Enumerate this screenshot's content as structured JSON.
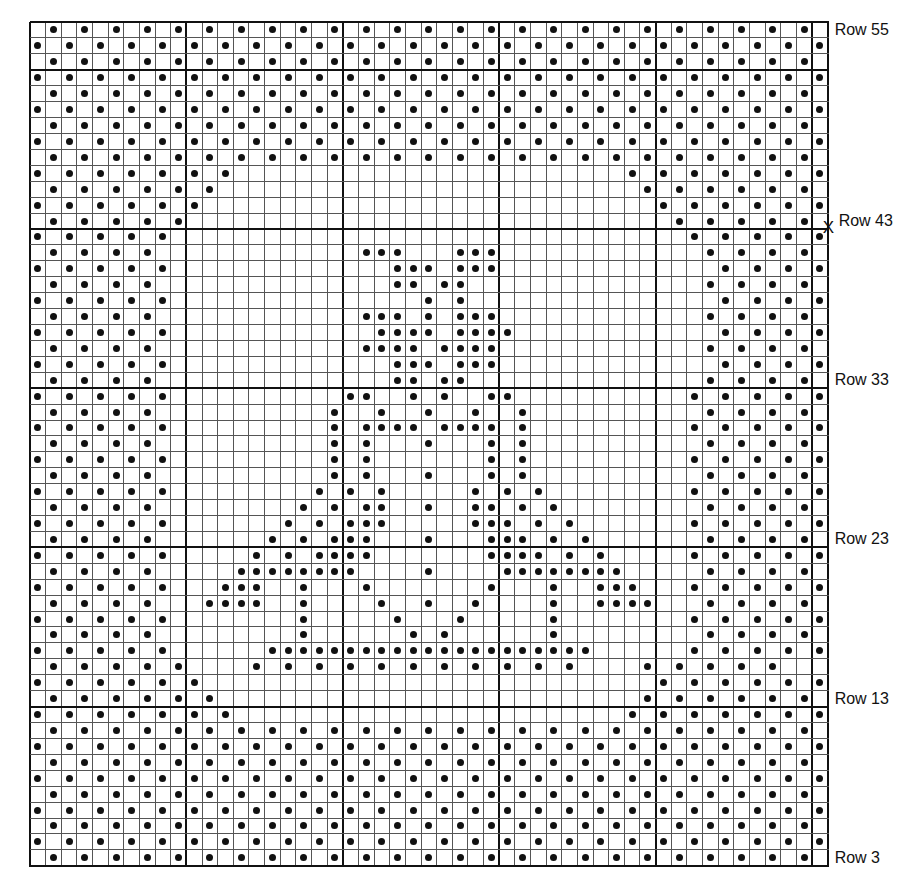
{
  "chart_title": "",
  "legend": {
    "dot": "filled cell",
    "blank": "empty cell"
  },
  "grid": {
    "columns": 51,
    "rows": 53,
    "first_row_number_top": 55,
    "last_row_number_bottom": 3,
    "major_col_lines": [
      0,
      10,
      20,
      30,
      40,
      50,
      51
    ],
    "major_row_lines": [
      0,
      3,
      13,
      23,
      33,
      43,
      53
    ],
    "dot_color": "#111111",
    "line_color": "#555555",
    "major_line_color": "#111111"
  },
  "row_labels": [
    {
      "row_index": 0,
      "text": "Row 55",
      "marker": ""
    },
    {
      "row_index": 12,
      "text": "Row 43",
      "marker": "X"
    },
    {
      "row_index": 22,
      "text": "Row 33",
      "marker": ""
    },
    {
      "row_index": 32,
      "text": "Row 23",
      "marker": ""
    },
    {
      "row_index": 42,
      "text": "Row 13",
      "marker": ""
    },
    {
      "row_index": 52,
      "text": "Row 3",
      "marker": ""
    }
  ],
  "chart_data": {
    "type": "heatmap",
    "xlabel": "",
    "ylabel": "Row",
    "legend": [
      "o = dot (filled block)",
      ". = open mesh"
    ],
    "row_order": "top-to-bottom, Row 55 first",
    "cells": [
      ".o.o.o.o.o.o.o.o.o.o.o.o.o.o.o.o.o.o.o.o.o.o.o.o.o.",
      "o.o.o.o.o.o.o.o.o.o.o.o.o.o.o.o.o.o.o.o.o.o.o.o.o.o",
      ".o.o.o.o.o.o.o.o.o.o.o.o.o.o.o.o.o.o.o.o.o.o.o.o.o.",
      "o.o.o.o.o.o.o.o.o.o.o.o.o.o.o.o.o.o.o.o.o.o.o.o.o.o",
      ".o.o.o.o.o.o.o.o.o.o.o.o.o.o.o.o.o.o.o.o.o.o.o.o.o.",
      "o.o.o.o.o.o.o.o.o.o.o.o.o.o.o.o.o.o.o.o.o.o.o.o.o.o",
      ".o.o.o.o.o.o.o.o.o.o.o.o.o.o.o.o.o.o.o.o.o.o.o.o.o.",
      "o.o.o.o.o.o.o.o.o.o.o.o.o.o.o.o.o.o.o.o.o.o.o.o.o.o",
      ".o.o.o.o.o.o.o.o.o.o.o.o.o.o.o.o.o.o.o.o.o.o.o.o.o.",
      "o.o.o.o.o.o.o.........................o.o.o.o.o.o.o",
      ".o.o.o.o.o.o...........................o.o.o.o.o.o.",
      "o.o.o.o.o.o.............................o.o.o.o.o.o",
      ".o.o.o.o.o...............................o.o.o.o.o.",
      "o.o.o.o.o.................................o.o.o.o.o",
      ".o.o.o.o.............ooo...ooo.............o.o.o.o.",
      "o.o.o.o.o..............ooo.ooo..............o.o.o.o.o",
      ".o.o.o.o...............oo.oo...............o.o.o.o.",
      "o.o.o.o.o................o.o................o.o.o.o.o",
      ".o.o.o.o.............ooo.o.ooo.............o.o.o.o.",
      "o.o.o.o.o.............oooo.oooo.............o.o.o.o.o",
      ".o.o.o.o.............oooo.oooo.............o.o.o.o.",
      "o.o.o.o.o..............ooo.ooo..............o.o.o.o.o",
      ".o.o.o.o...............oo.oo...............o.o.o.o.",
      "o.o.o.o.o...........oo..o.o..oo...........o.o.o.o.o",
      ".o.o.o.o...........o..o..o..o..o...........o.o.o.o.",
      "o.o.o.o.o..........o.oooo.oooo.o..........o.o.o.o.o",
      ".o.o.o.o...........o.o...o...o.o...........o.o.o.o.",
      "o.o.o.o.o..........o.o.......o.o..........o.o.o.o.o",
      ".o.o.o.o...........o.o...o...o.o...........o.o.o.o.",
      "o.o.o.o.o.........o.o.o.....o.o.o.........o.o.o.o.o",
      ".o.o.o.o.........o.o.oo..o..oo.o.o.........o.o.o.o.",
      "o.o.o.o.o.......o.o.ooo.....ooo.o.o.......o.o.o.o.o",
      ".o.o.o.o.......o.o.ooo...o...ooo.o.o.......o.o.o.o.",
      "o.o.o.o.o.....o.o.oooo.......oooo.o.o.....o.o.o.o.o",
      ".o.o.o.o.....oooooooo....o....oooooooo.....o.o.o.o.",
      "o.o.o.o.o...ooo..o...o.......o...o..ooo...o.o.o.o.o",
      ".o.o.o.o...oooo..o....o..o..o....o..oooo...o.o.o.o.",
      "o.o.o.o.o........o.....o...o.....o........o.o.o.o.o",
      ".o.o.o.o.........o......o.o......o.........o.o.o.o.",
      "o.o.o.o.o......ooooooooooooooooooooo......o.o.o.o.o",
      ".o.o.o.o.o....o.o.o.o.o.o.o.o.o.o.o....o.o.o.o.o.",
      "o.o.o.o.o.o.............................o.o.o.o.o.o",
      ".o.o.o.o.o.o...........................o.o.o.o.o.o.",
      "o.o.o.o.o.o.o.........................o.o.o.o.o.o.o",
      ".o.o.o.o.o.o.o.o.o.o.o.o.o.o.o.o.o.o.o.o.o.o.o.o.o.",
      "o.o.o.o.o.o.o.o.o.o.o.o.o.o.o.o.o.o.o.o.o.o.o.o.o.o",
      ".o.o.o.o.o.o.o.o.o.o.o.o.o.o.o.o.o.o.o.o.o.o.o.o.o.",
      "o.o.o.o.o.o.o.o.o.o.o.o.o.o.o.o.o.o.o.o.o.o.o.o.o.o",
      ".o.o.o.o.o.o.o.o.o.o.o.o.o.o.o.o.o.o.o.o.o.o.o.o.o.",
      "o.o.o.o.o.o.o.o.o.o.o.o.o.o.o.o.o.o.o.o.o.o.o.o.o.o",
      ".o.o.o.o.o.o.o.o.o.o.o.o.o.o.o.o.o.o.o.o.o.o.o.o.o.",
      "o.o.o.o.o.o.o.o.o.o.o.o.o.o.o.o.o.o.o.o.o.o.o.o.o.o",
      ".o.o.o.o.o.o.o.o.o.o.o.o.o.o.o.o.o.o.o.o.o.o.o.o.o."
    ]
  }
}
